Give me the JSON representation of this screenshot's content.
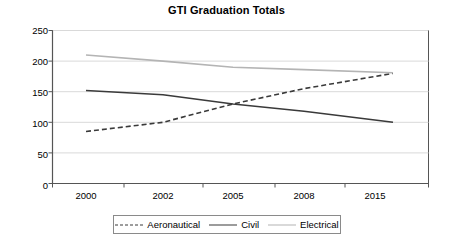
{
  "chart_data": {
    "type": "line",
    "title": "GTI Graduation Totals",
    "xlabel": "",
    "ylabel": "",
    "x": [
      "2000",
      "2002",
      "2005",
      "2008",
      "2015"
    ],
    "categories": [
      "2000",
      "2002",
      "2005",
      "2008",
      "2015"
    ],
    "series": [
      {
        "name": "Aeronautical",
        "values": [
          85,
          100,
          130,
          155,
          180
        ],
        "style": "dashed",
        "color": "#3a3a3a"
      },
      {
        "name": "Civil",
        "values": [
          152,
          145,
          130,
          118,
          100
        ],
        "style": "solid",
        "color": "#3a3a3a"
      },
      {
        "name": "Electrical",
        "values": [
          210,
          200,
          190,
          186,
          181
        ],
        "style": "solid",
        "color": "#b4b4b4"
      }
    ],
    "ylim": [
      0,
      250
    ],
    "yticks": [
      0,
      50,
      100,
      150,
      200,
      250
    ],
    "ytick_labels": [
      "0",
      "50",
      "100",
      "150",
      "200",
      "250"
    ],
    "xtick_labels": [
      "2000",
      "2002",
      "2005",
      "2008",
      "2015"
    ],
    "grid": "horizontal",
    "legend_position": "bottom",
    "legend_entries": [
      "Aeronautical",
      "Civil",
      "Electrical"
    ],
    "plot_border_color": "#555555",
    "gridline_color": "#d9d9d9",
    "background": "#ffffff"
  },
  "axes": {
    "y_labels": [
      "250",
      "200",
      "150",
      "100",
      "50",
      "0"
    ],
    "x_labels": [
      "2000",
      "2002",
      "2005",
      "2008",
      "2015"
    ]
  },
  "legend": {
    "items": [
      {
        "label": "Aeronautical",
        "swatch": "dashed-line-icon"
      },
      {
        "label": "Civil",
        "swatch": "solid-dark-line-icon"
      },
      {
        "label": "Electrical",
        "swatch": "solid-light-line-icon"
      }
    ]
  }
}
